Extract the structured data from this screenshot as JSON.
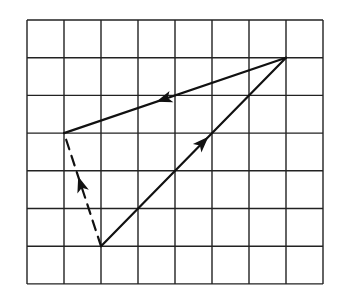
{
  "diagram": {
    "type": "vector-addition-grid",
    "grid": {
      "columns": 8,
      "rows": 7,
      "origin_px": [
        27,
        20
      ],
      "cell_w_px": 37,
      "cell_h_px": 37.7,
      "line_color": "#222222",
      "background": "#ffffff"
    },
    "vectors": [
      {
        "id": "vector-a",
        "style": "solid",
        "from": [
          2,
          6
        ],
        "to": [
          7,
          1
        ],
        "arrow_position": 0.55,
        "color": "#111111"
      },
      {
        "id": "vector-b",
        "style": "solid",
        "from": [
          7,
          1
        ],
        "to": [
          1,
          3
        ],
        "arrow_position": 0.55,
        "color": "#111111"
      },
      {
        "id": "vector-resultant",
        "style": "dashed",
        "from": [
          2,
          6
        ],
        "to": [
          1,
          3
        ],
        "arrow_position": 0.55,
        "color": "#111111"
      }
    ]
  }
}
